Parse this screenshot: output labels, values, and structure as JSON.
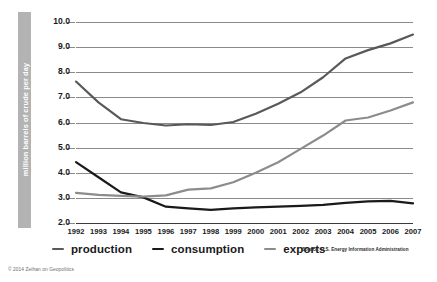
{
  "chart_data": {
    "type": "line",
    "title": "",
    "xlabel": "",
    "ylabel": "million barrels of crude per day",
    "ylim": [
      2.0,
      10.0
    ],
    "ytick_labels": [
      "10.0",
      "9.0",
      "8.0",
      "7.0",
      "6.0",
      "5.0",
      "4.0",
      "3.0",
      "2.0"
    ],
    "ytick_values": [
      10.0,
      9.0,
      8.0,
      7.0,
      6.0,
      5.0,
      4.0,
      3.0,
      2.0
    ],
    "grid": true,
    "legend_position": "below",
    "categories": [
      "1992",
      "1993",
      "1994",
      "1995",
      "1996",
      "1997",
      "1998",
      "1999",
      "2000",
      "2001",
      "2002",
      "2003",
      "2004",
      "2005",
      "2006",
      "2007"
    ],
    "x": [
      1992,
      1993,
      1994,
      1995,
      1996,
      1997,
      1998,
      1999,
      2000,
      2001,
      2002,
      2003,
      2004,
      2005,
      2006,
      2007
    ],
    "series": [
      {
        "name": "production",
        "color": "#595959",
        "values": [
          7.63,
          6.8,
          6.13,
          5.98,
          5.88,
          5.93,
          5.9,
          6.02,
          6.35,
          6.75,
          7.2,
          7.8,
          8.55,
          8.88,
          9.15,
          9.5
        ]
      },
      {
        "name": "consumption",
        "color": "#1a1a1a",
        "values": [
          4.42,
          3.82,
          3.22,
          3.02,
          2.65,
          2.58,
          2.52,
          2.58,
          2.62,
          2.65,
          2.68,
          2.72,
          2.8,
          2.86,
          2.88,
          2.78
        ]
      },
      {
        "name": "exports",
        "color": "#8c8c8c",
        "values": [
          3.2,
          3.12,
          3.08,
          3.05,
          3.1,
          3.33,
          3.38,
          3.62,
          4.0,
          4.42,
          4.95,
          5.48,
          6.08,
          6.2,
          6.48,
          6.8
        ]
      }
    ],
    "source_note": "Source: U.S. Energy Information Administration"
  },
  "legend": {
    "items": [
      {
        "label": "production"
      },
      {
        "label": "consumption"
      },
      {
        "label": "exports"
      }
    ]
  },
  "footer": {
    "copyright": "© 2014 Zeihan on Geopolitics"
  }
}
